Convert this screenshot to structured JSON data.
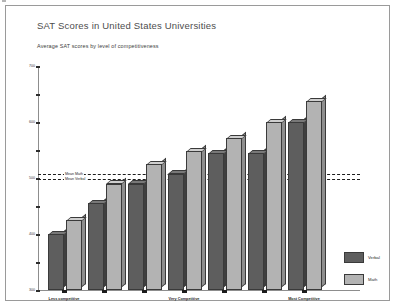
{
  "title": "SAT Scores in United States Universities",
  "subtitle": "Average SAT scores by level of competitiveness",
  "legend": {
    "verbal_label": "Verbal",
    "math_label": "Math"
  },
  "reference_lines": {
    "math_label": "Mean Math",
    "verbal_label": "Mean Verbal"
  },
  "colors": {
    "verbal": "#5e5e5e",
    "math": "#b3b3b3",
    "axis": "#8d8d8d",
    "frame": "#9a9a9a",
    "title": "#4d4d4d"
  },
  "chart_data": {
    "type": "bar",
    "title": "SAT Scores in United States Universities",
    "subtitle": "Average SAT scores by level of competitiveness",
    "xlabel": "",
    "ylabel": "",
    "ylim": [
      300,
      700
    ],
    "yticks": [
      300,
      350,
      400,
      450,
      500,
      550,
      600,
      650,
      700
    ],
    "ytick_labels": [
      "300",
      "",
      "400",
      "",
      "500",
      "",
      "600",
      "",
      "700"
    ],
    "grid": false,
    "legend_position": "right",
    "categories": [
      "Less competitive",
      "",
      "",
      "Very Competitive",
      "",
      "",
      "Most Competitive"
    ],
    "series": [
      {
        "name": "Verbal",
        "values": [
          400,
          455,
          490,
          508,
          545,
          545,
          600
        ]
      },
      {
        "name": "Math",
        "values": [
          425,
          490,
          525,
          548,
          572,
          600,
          638
        ]
      }
    ],
    "reference_lines": [
      {
        "label": "Mean Math",
        "value": 508
      },
      {
        "label": "Mean Verbal",
        "value": 498
      }
    ]
  }
}
